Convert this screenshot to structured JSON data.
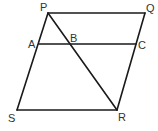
{
  "diagram": {
    "type": "geometry-parallelogram",
    "line_color": "#1a1a1a",
    "label_color": "#333333",
    "points": {
      "P": {
        "label": "P",
        "x": 48,
        "y": 13
      },
      "Q": {
        "label": "Q",
        "x": 145,
        "y": 13
      },
      "R": {
        "label": "R",
        "x": 117,
        "y": 110
      },
      "S": {
        "label": "S",
        "x": 17,
        "y": 110
      },
      "A": {
        "label": "A",
        "x": 39,
        "y": 44
      },
      "B": {
        "label": "B",
        "x": 69,
        "y": 44
      },
      "C": {
        "label": "C",
        "x": 136,
        "y": 44
      }
    },
    "segments": [
      {
        "name": "PQ",
        "from": "P",
        "to": "Q"
      },
      {
        "name": "QR",
        "from": "Q",
        "to": "R"
      },
      {
        "name": "RS",
        "from": "R",
        "to": "S"
      },
      {
        "name": "SP",
        "from": "S",
        "to": "P"
      },
      {
        "name": "AC",
        "from": "A",
        "to": "C"
      },
      {
        "name": "PR",
        "from": "P",
        "to": "R"
      }
    ]
  }
}
